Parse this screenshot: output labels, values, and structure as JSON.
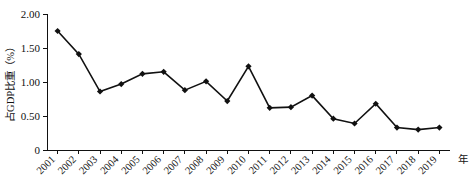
{
  "chart_data": {
    "type": "line",
    "title": "",
    "xlabel": "年",
    "ylabel": "占GDP比重（%）",
    "categories": [
      "2001",
      "2002",
      "2003",
      "2004",
      "2005",
      "2006",
      "2007",
      "2008",
      "2009",
      "2010",
      "2011",
      "2012",
      "2013",
      "2014",
      "2015",
      "2016",
      "2017",
      "2018",
      "2019"
    ],
    "values": [
      1.75,
      1.41,
      0.86,
      0.97,
      1.12,
      1.15,
      0.88,
      1.01,
      0.72,
      1.23,
      0.62,
      0.63,
      0.8,
      0.46,
      0.39,
      0.68,
      0.33,
      0.3,
      0.33
    ],
    "ylim": [
      0,
      2.0
    ],
    "yticks": [
      0,
      0.5,
      1.0,
      1.5,
      2.0
    ],
    "ytick_labels": [
      "0",
      "0.50",
      "1.00",
      "1.50",
      "2.00"
    ],
    "grid": false,
    "legend": null,
    "marker": "diamond",
    "series_color": "#111111"
  },
  "axes": {
    "y_axis_title": "占GDP比重（%）",
    "x_axis_unit": "年"
  },
  "caption": {
    "clipped_text": ""
  }
}
